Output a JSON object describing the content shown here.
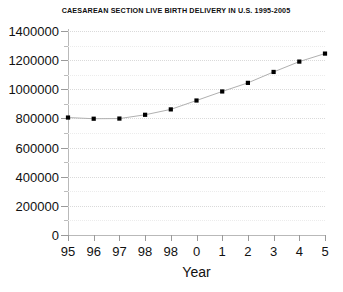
{
  "chart_data": {
    "type": "line",
    "title": "CAESAREAN SECTION LIVE BIRTH DELIVERY IN U.S. 1995-2005",
    "xlabel": "Year",
    "ylabel": "",
    "categories": [
      "95",
      "96",
      "97",
      "98",
      "98",
      "0",
      "1",
      "2",
      "3",
      "4",
      "5"
    ],
    "values": [
      806000,
      798000,
      799000,
      825000,
      862000,
      923000,
      985000,
      1044000,
      1119000,
      1190000,
      1245000
    ],
    "series": [
      {
        "name": "Caesarean section live births",
        "values": [
          806000,
          798000,
          799000,
          825000,
          862000,
          923000,
          985000,
          1044000,
          1119000,
          1190000,
          1245000
        ]
      }
    ],
    "ylim": [
      0,
      1400000
    ],
    "ytick_labels": [
      "0",
      "200000",
      "400000",
      "600000",
      "800000",
      "1000000",
      "1200000",
      "1400000"
    ],
    "ytick_values": [
      0,
      200000,
      400000,
      600000,
      800000,
      1000000,
      1200000,
      1400000
    ],
    "yminor_values": [
      100000,
      300000,
      500000,
      700000,
      900000,
      1100000,
      1300000
    ],
    "grid": true,
    "grid_style": "dotted",
    "legend": false,
    "marker": "square",
    "marker_color": "#000000",
    "line_color": "#b0b0b0",
    "grid_color": "#dadada",
    "axis_color": "#b9b9b9",
    "text_color": "#111111",
    "background": "#ffffff"
  }
}
